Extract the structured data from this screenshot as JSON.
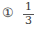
{
  "option": {
    "marker": "①",
    "fraction": {
      "numerator": "1",
      "denominator": "3"
    }
  }
}
